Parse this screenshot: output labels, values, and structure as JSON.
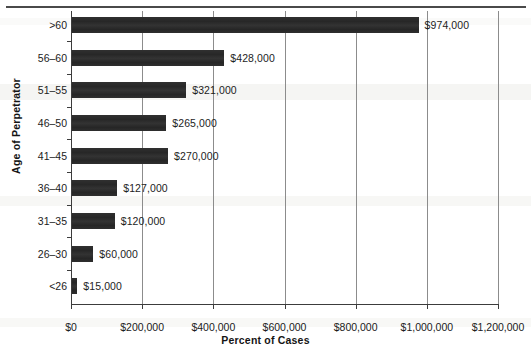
{
  "chart_data": {
    "type": "bar",
    "orientation": "horizontal",
    "title": "",
    "xlabel": "Percent of Cases",
    "ylabel": "Age of Perpetrator",
    "categories": [
      ">60",
      "56–60",
      "51–55",
      "46–50",
      "41–45",
      "36–40",
      "31–35",
      "26–30",
      "<26"
    ],
    "values": [
      974000,
      428000,
      321000,
      265000,
      270000,
      127000,
      120000,
      60000,
      15000
    ],
    "data_labels": [
      "$974,000",
      "$428,000",
      "$321,000",
      "$265,000",
      "$270,000",
      "$127,000",
      "$120,000",
      "$60,000",
      "$15,000"
    ],
    "xlim": [
      0,
      1200000
    ],
    "xtick_values": [
      0,
      200000,
      400000,
      600000,
      800000,
      1000000,
      1200000
    ],
    "xtick_labels": [
      "$0",
      "$200,000",
      "$400,000",
      "$600,000",
      "$800,000",
      "$1,000,000",
      "$1,200,000"
    ],
    "grid": "vertical",
    "legend": "none",
    "bar_color": "#2b2b2b",
    "axis_color": "#3c3c3c",
    "gridline_color": "#8c8c8c"
  }
}
